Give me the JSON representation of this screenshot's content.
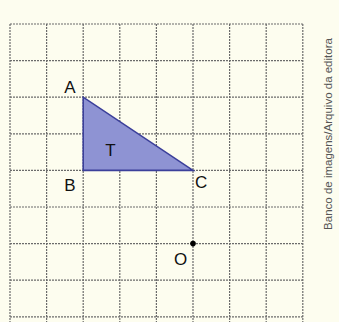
{
  "figure": {
    "grid": {
      "x0": 10,
      "y0": 24,
      "cell": 36.6,
      "columns": 8,
      "rows": 8,
      "line_color": "#6b6b6b",
      "open_bottom": true
    },
    "triangle": {
      "label": "T",
      "vertices": [
        {
          "name": "A",
          "col": 2,
          "row": 2
        },
        {
          "name": "B",
          "col": 2,
          "row": 4
        },
        {
          "name": "C",
          "col": 5,
          "row": 4
        }
      ],
      "fill": "#8e93d3",
      "stroke": "#3b3f9a"
    },
    "labels": {
      "A": "A",
      "B": "B",
      "C": "C",
      "T": "T",
      "O": "O"
    },
    "point_O": {
      "name": "O",
      "col": 5,
      "row": 6
    },
    "credit": "Banco de imagens/Arquivo da editora"
  }
}
